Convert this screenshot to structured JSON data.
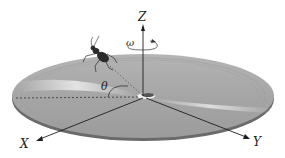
{
  "diagram": {
    "axes": {
      "z_label": "Z",
      "x_label": "X",
      "y_label": "Y"
    },
    "angular_velocity_label": "ω",
    "angle_label": "θ"
  },
  "colors": {
    "disk": "#a9a9a9",
    "disk_edge": "#6e6e6e",
    "axis": "#1e1e1e",
    "highlight": "#e8e8e8"
  }
}
